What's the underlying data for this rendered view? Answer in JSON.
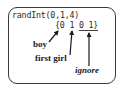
{
  "diagram": {
    "command": "randInt(0,1,4)",
    "output": "{0 1 0 1}",
    "annotations": [
      {
        "label": "boy",
        "points_to": "first 0",
        "style": "bold"
      },
      {
        "label": "first girl",
        "points_to": "first 1",
        "style": "bold"
      },
      {
        "label": "ignore",
        "points_to": "last two digits (0 1)",
        "style": "italic bold"
      }
    ],
    "underlined_segment": "0 1"
  }
}
